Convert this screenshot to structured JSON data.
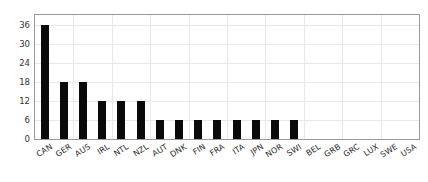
{
  "chart_data": {
    "type": "bar",
    "title": "",
    "subtitle": "",
    "xlabel": "",
    "ylabel": "",
    "categories": [
      "CAN",
      "GER",
      "AUS",
      "IRL",
      "NTL",
      "NZL",
      "AUT",
      "DNK",
      "FIN",
      "FRA",
      "ITA",
      "JPN",
      "NOR",
      "SWI",
      "BEL",
      "GRB",
      "GRC",
      "LUX",
      "SWE",
      "USA"
    ],
    "values": [
      36,
      18,
      18,
      12,
      12,
      12,
      6,
      6,
      6,
      6,
      6,
      6,
      6,
      6,
      0,
      0,
      0,
      0,
      0,
      0
    ],
    "ylim": [
      0,
      39
    ],
    "yticks": [
      0,
      6,
      12,
      18,
      24,
      30,
      36
    ],
    "ytick_labels": [
      "0",
      "6",
      "12",
      "18",
      "24",
      "30",
      "36"
    ],
    "grid": true,
    "legend": false,
    "bar_color": "#0a0a0a",
    "grid_color": "#e8e8e8",
    "frame_color": "#9a9a9a",
    "background_color": "#ffffff",
    "xtick_rotation": -32
  }
}
